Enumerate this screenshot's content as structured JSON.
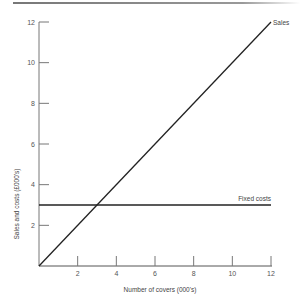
{
  "chart_data": {
    "type": "line",
    "title": "",
    "xlabel": "Number of covers (000's)",
    "ylabel": "Sales and costs (£000's)",
    "xlim": [
      0,
      12
    ],
    "ylim": [
      0,
      12
    ],
    "xticks": [
      2,
      4,
      6,
      8,
      10,
      12
    ],
    "yticks": [
      2,
      4,
      6,
      8,
      10,
      12
    ],
    "xtick_labels": [
      "2",
      "4",
      "6",
      "8",
      "10",
      "12"
    ],
    "ytick_labels": [
      "2",
      "4",
      "6",
      "8",
      "10",
      "12"
    ],
    "grid": false,
    "series": [
      {
        "name": "Sales",
        "x": [
          0,
          12
        ],
        "y": [
          0,
          12
        ]
      },
      {
        "name": "Fixed costs",
        "x": [
          0,
          12
        ],
        "y": [
          3,
          3
        ]
      }
    ],
    "annotations": [
      {
        "text": "Sales",
        "attached_to": "Sales",
        "position": "end"
      },
      {
        "text": "Fixed costs",
        "attached_to": "Fixed costs",
        "position": "end-above"
      }
    ]
  }
}
